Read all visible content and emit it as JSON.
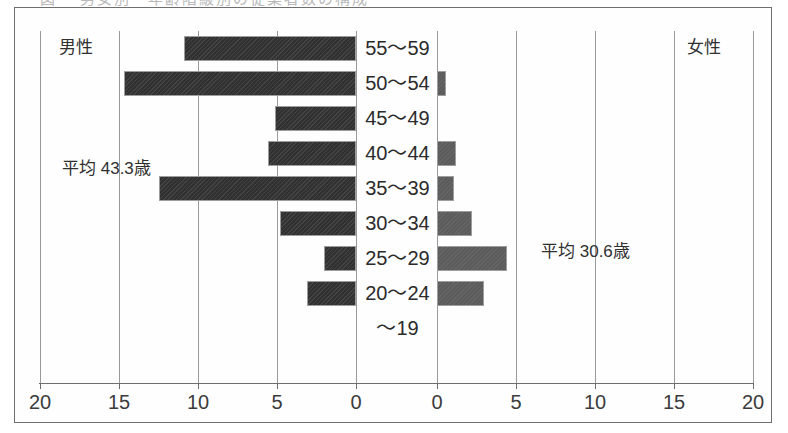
{
  "top_cut_caption": "図 　男女別・年齢階級別の従業者数の構成",
  "chart_data": {
    "type": "bar",
    "subtype": "population-pyramid",
    "title": "",
    "xlabel": "",
    "ylabel": "",
    "categories": [
      "55～59",
      "50～54",
      "45～49",
      "40～44",
      "35～39",
      "30～34",
      "25～29",
      "20～24",
      "～19"
    ],
    "series": [
      {
        "name": "男性",
        "side": "left",
        "color": "#313131",
        "values": [
          10.9,
          14.7,
          5.1,
          5.6,
          12.5,
          4.8,
          2.0,
          3.1,
          0.0
        ]
      },
      {
        "name": "女性",
        "side": "right",
        "color": "#5c5c5c",
        "values": [
          0.0,
          0.6,
          0.0,
          1.2,
          1.1,
          2.2,
          4.4,
          3.0,
          0.0
        ]
      }
    ],
    "xlim_left": [
      0,
      20
    ],
    "xlim_right": [
      0,
      20
    ],
    "tick_values_left": [
      "20",
      "15",
      "10",
      "5",
      "0"
    ],
    "tick_values_right": [
      "0",
      "5",
      "10",
      "15",
      "20"
    ],
    "grid": true,
    "legend_position": "top-corners",
    "annotations": [
      {
        "name": "male-mean",
        "text": "平均 43.3歳"
      },
      {
        "name": "female-mean",
        "text": "平均 30.6歳"
      }
    ]
  },
  "labels": {
    "male_heading": "男性",
    "female_heading": "女性",
    "male_mean": "平均 43.3歳",
    "female_mean": "平均 30.6歳"
  },
  "colors": {
    "male_bar": "#313131",
    "female_bar": "#5c5c5c",
    "frame": "#6e6e6e",
    "gridline": "#9a9a9a",
    "text": "#2b2b2b",
    "background": "#ffffff"
  }
}
